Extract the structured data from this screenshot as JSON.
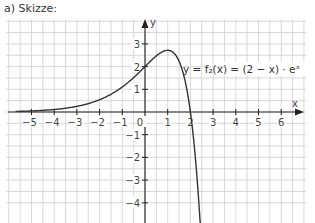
{
  "caption": "a) Skizze:",
  "function_label": "y = f₂(x) = (2 − x) · eˣ",
  "axes": {
    "x_label": "x",
    "y_label": "y",
    "x_ticks": [
      "−5",
      "−4",
      "−3",
      "−2",
      "−1",
      "0",
      "1",
      "2",
      "3",
      "4",
      "5",
      "6"
    ],
    "y_ticks": [
      "3",
      "2",
      "1",
      "−1",
      "−2",
      "−3",
      "−4"
    ]
  },
  "chart_data": {
    "type": "line",
    "title": "a) Skizze:",
    "xlabel": "x",
    "ylabel": "y",
    "xlim": [
      -5.9,
      6.9
    ],
    "ylim": [
      -4.8,
      3.9
    ],
    "grid": true,
    "series": [
      {
        "name": "y = f2(x) = (2 - x) · e^x",
        "x": [
          -5.7,
          -5,
          -4,
          -3,
          -2,
          -1,
          0,
          0.5,
          1,
          1.5,
          1.8,
          2,
          2.2,
          2.4,
          2.5
        ],
        "y": [
          0.026,
          0.047,
          0.11,
          0.249,
          0.541,
          1.104,
          2.0,
          2.473,
          2.718,
          2.241,
          1.21,
          0.0,
          -1.805,
          -4.409,
          -6.09
        ]
      }
    ]
  },
  "colors": {
    "grid": "#c8c8c8",
    "axis": "#222222",
    "curve": "#333333"
  }
}
